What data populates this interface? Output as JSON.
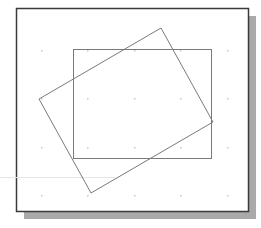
{
  "diagram": {
    "type": "geometry-figure",
    "colors": {
      "background": "#ffffff",
      "frame_border": "#3a3a3a",
      "shadow": "#a9a9a9",
      "shape_stroke": "#7a7a7a",
      "grid_dot": "#c8c8c8",
      "guide_line": "#e6e6e6"
    },
    "frame": {
      "x": 16,
      "y": 8,
      "width": 232,
      "height": 203
    },
    "shadow": {
      "offset_x": 8,
      "offset_y": 8
    },
    "grid": {
      "xs": [
        41,
        87,
        134,
        180,
        227
      ],
      "ys": [
        50,
        98,
        147,
        195
      ]
    },
    "shapes": [
      {
        "name": "axis-aligned-rectangle",
        "kind": "rect",
        "x": 73,
        "y": 49,
        "width": 138,
        "height": 109
      },
      {
        "name": "rotated-rectangle",
        "kind": "polygon",
        "points": [
          [
            161,
            28
          ],
          [
            213,
            122
          ],
          [
            91,
            193
          ],
          [
            39,
            99
          ]
        ]
      }
    ],
    "guide_line": {
      "x1": 0,
      "y1": 177,
      "x2": 115,
      "y2": 177
    }
  }
}
